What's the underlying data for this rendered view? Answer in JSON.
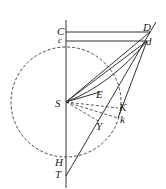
{
  "diagram": {
    "stroke_color": "#333333",
    "labels": {
      "C": "C",
      "c": "c",
      "D": "D",
      "d": "d",
      "S": "S",
      "E": "E",
      "K": "K",
      "k": "k",
      "Y": "Y",
      "H": "H",
      "T": "T"
    }
  }
}
